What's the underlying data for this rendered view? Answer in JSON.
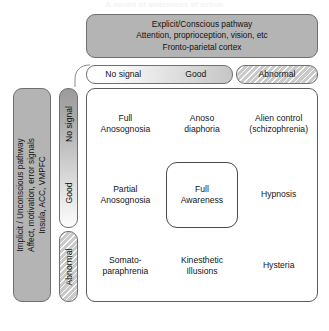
{
  "figure": {
    "title": "A model of awareness of action"
  },
  "top_pathway": {
    "name": "explicit-conscious-pathway",
    "lines": [
      "Explicit/Conscious pathway",
      "Attention, proprioception, vision, etc",
      "Fronto-parietal cortex"
    ]
  },
  "left_pathway": {
    "name": "implicit-unconscious-pathway",
    "lines": [
      "Implicit / Unconscious pathway",
      "Affect, motivation, error signals",
      "Insula, ACC, VMPFC"
    ]
  },
  "column_headers": {
    "no_signal": "No signal",
    "good": "Good",
    "abnormal": "Abnormal"
  },
  "row_headers": {
    "no_signal": "No signal",
    "good": "Good",
    "abnormal": "Abnormal"
  },
  "matrix": {
    "rows": [
      {
        "row_label": "No signal",
        "cells": [
          {
            "text": "Full\nAnosognosia",
            "highlight": false
          },
          {
            "text": "Anoso\ndiaphoria",
            "highlight": false
          },
          {
            "text": "Alien control\n(schizophrenia)",
            "highlight": false
          }
        ]
      },
      {
        "row_label": "Good",
        "cells": [
          {
            "text": "Partial\nAnosognosia",
            "highlight": false
          },
          {
            "text": "Full\nAwareness",
            "highlight": true
          },
          {
            "text": "Hypnosis",
            "highlight": false
          }
        ]
      },
      {
        "row_label": "Abnormal",
        "cells": [
          {
            "text": "Somato-\nparaphrenia",
            "highlight": false
          },
          {
            "text": "Kinesthetic\nIllusions",
            "highlight": false
          },
          {
            "text": "Hysteria",
            "highlight": false
          }
        ]
      }
    ]
  },
  "colors": {
    "pathway_fill": "#b4b4b4",
    "pathway_border": "#6f6f6f",
    "matrix_border": "#5d5d5d",
    "header_border": "#707070",
    "abnormal_fill": "#d8d8d8",
    "page_background": "#ffffff",
    "text": "#151515"
  }
}
